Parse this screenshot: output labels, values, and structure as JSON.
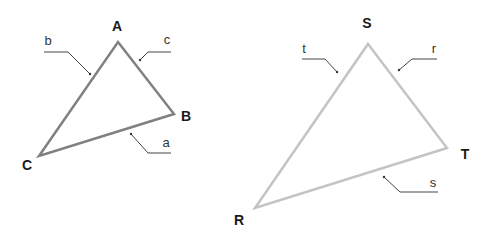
{
  "figure": {
    "width": 494,
    "height": 239,
    "background": "#ffffff"
  },
  "triangles": [
    {
      "id": "ABC",
      "stroke_color": "#808080",
      "stroke_width": 2.5,
      "vertices": [
        {
          "name": "A",
          "x": 118,
          "y": 42,
          "label_x": 117,
          "label_y": 31
        },
        {
          "name": "B",
          "x": 174,
          "y": 114,
          "label_x": 186,
          "label_y": 121
        },
        {
          "name": "C",
          "x": 39,
          "y": 156,
          "label_x": 27,
          "label_y": 170
        }
      ],
      "sides": [
        {
          "name": "b",
          "label_x": 48,
          "label_y": 45,
          "leader": "44,52 68,52 90,74"
        },
        {
          "name": "c",
          "label_x": 167,
          "label_y": 44,
          "leader": "171,52 148,52 140,60"
        },
        {
          "name": "a",
          "label_x": 165,
          "label_y": 147,
          "leader": "171,153 148,153 131,134"
        }
      ]
    },
    {
      "id": "RST",
      "stroke_color": "#c4c4c4",
      "stroke_width": 2.5,
      "vertices": [
        {
          "name": "S",
          "x": 368,
          "y": 44,
          "label_x": 367,
          "label_y": 28
        },
        {
          "name": "T",
          "x": 447,
          "y": 148,
          "label_x": 465,
          "label_y": 159
        },
        {
          "name": "R",
          "x": 255,
          "y": 208,
          "label_x": 239,
          "label_y": 225
        }
      ],
      "sides": [
        {
          "name": "t",
          "label_x": 304,
          "label_y": 53,
          "leader": "302,59 325,59 337,72"
        },
        {
          "name": "r",
          "label_x": 434,
          "label_y": 53,
          "leader": "437,59 412,59 399,70"
        },
        {
          "name": "s",
          "label_x": 433,
          "label_y": 187,
          "leader": "438,192 400,192 384,177"
        }
      ]
    }
  ]
}
